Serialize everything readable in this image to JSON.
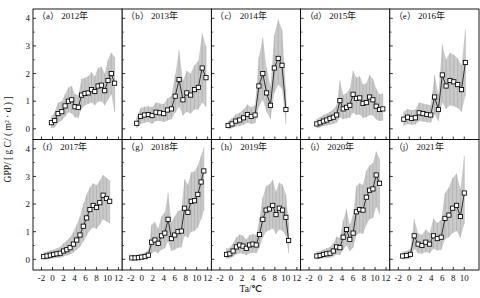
{
  "figure": {
    "name": "gpp-vs-air-temperature-panels",
    "ylabel": "GPP/ [ g C/ ( m² · d ) ]",
    "xlabel": "Ta/℃",
    "rows": 2,
    "cols": 5
  },
  "chart_data": {
    "type": "line",
    "title": "GPP/ [ g C/ ( m² · d ) ]",
    "xlabel": "Ta/℃",
    "ylabel": "GPP/ [ g C/ ( m² · d ) ]",
    "xlim": [
      -3,
      12.5
    ],
    "ylim": [
      -0.35,
      4.3
    ],
    "xticks": [
      -2,
      0,
      2,
      4,
      6,
      8,
      10,
      12
    ],
    "yticks": [
      0,
      1,
      2,
      3,
      4
    ],
    "grid": false,
    "legend": "none",
    "marker": "open-square",
    "band_label": "shaded standard-deviation envelope",
    "band_color": "#b8b8b8",
    "line_color": "#1a1a1a",
    "panels": [
      {
        "id": "a",
        "label": "（a）",
        "title": "2012年",
        "xticks": [
          -2,
          0,
          2,
          4,
          6,
          8,
          10,
          12
        ],
        "x": [
          -0.2,
          0.4,
          1.0,
          1.7,
          2.3,
          2.9,
          3.5,
          4.1,
          4.7,
          5.3,
          5.9,
          6.5,
          7.1,
          7.7,
          8.3,
          8.9,
          9.5,
          10.1,
          10.7,
          11.3
        ],
        "y": [
          0.22,
          0.3,
          0.55,
          0.62,
          0.83,
          1.0,
          1.05,
          0.8,
          0.78,
          1.22,
          1.28,
          1.3,
          1.42,
          1.35,
          1.55,
          1.58,
          1.38,
          1.75,
          2.0,
          1.65
        ],
        "lower": [
          0.02,
          0.05,
          0.22,
          0.3,
          0.45,
          0.6,
          0.55,
          0.42,
          0.4,
          0.72,
          0.85,
          0.9,
          0.95,
          0.85,
          0.98,
          1.0,
          0.85,
          1.05,
          1.25,
          0.6
        ],
        "upper": [
          0.45,
          0.6,
          0.95,
          1.0,
          1.25,
          1.5,
          1.55,
          1.25,
          1.22,
          1.8,
          1.85,
          1.9,
          2.05,
          1.9,
          2.2,
          2.25,
          2.0,
          2.5,
          2.75,
          2.6
        ]
      },
      {
        "id": "b",
        "label": "（b）",
        "title": "2013年",
        "xticks": [
          -2,
          0,
          2,
          4,
          6,
          8,
          10,
          12
        ],
        "x": [
          -0.9,
          -0.2,
          0.5,
          1.2,
          1.9,
          2.6,
          3.3,
          4.0,
          4.7,
          5.4,
          6.1,
          6.8,
          7.5,
          8.2,
          8.9,
          9.6,
          10.3,
          11.0,
          11.7
        ],
        "y": [
          0.2,
          0.45,
          0.5,
          0.52,
          0.48,
          0.6,
          0.58,
          0.55,
          0.68,
          0.72,
          1.18,
          1.78,
          1.05,
          1.3,
          1.22,
          1.42,
          1.5,
          2.2,
          1.85
        ],
        "lower": [
          0.02,
          0.18,
          0.22,
          0.25,
          0.18,
          0.28,
          0.28,
          0.25,
          0.3,
          0.35,
          0.58,
          0.8,
          0.48,
          0.62,
          0.55,
          0.7,
          0.7,
          0.95,
          0.8
        ],
        "upper": [
          0.42,
          0.75,
          0.8,
          0.82,
          0.78,
          0.95,
          0.92,
          0.9,
          1.1,
          1.2,
          1.95,
          2.85,
          1.75,
          2.1,
          2.0,
          2.3,
          2.45,
          3.45,
          3.0
        ]
      },
      {
        "id": "c",
        "label": "（c）",
        "title": "2014年",
        "xticks": [
          -2,
          0,
          2,
          4,
          6,
          8,
          10,
          12
        ],
        "x": [
          -0.5,
          0.2,
          0.9,
          1.6,
          2.3,
          3.0,
          3.7,
          4.4,
          5.1,
          5.8,
          6.5,
          7.2,
          7.9,
          8.6,
          9.3,
          10.0
        ],
        "y": [
          0.12,
          0.18,
          0.28,
          0.32,
          0.4,
          0.52,
          0.45,
          0.5,
          1.55,
          2.0,
          1.3,
          0.85,
          2.2,
          2.55,
          2.3,
          0.7
        ],
        "lower": [
          0.0,
          0.02,
          0.08,
          0.1,
          0.15,
          0.22,
          0.18,
          0.2,
          0.8,
          1.05,
          0.62,
          0.35,
          1.3,
          1.6,
          1.45,
          0.18
        ],
        "upper": [
          0.28,
          0.38,
          0.52,
          0.58,
          0.7,
          0.88,
          0.78,
          0.85,
          2.6,
          3.3,
          2.2,
          1.55,
          3.4,
          3.95,
          3.6,
          1.45
        ]
      },
      {
        "id": "d",
        "label": "（d）",
        "title": "2015年",
        "xticks": [
          -2,
          0,
          2,
          4,
          6,
          8,
          10,
          12
        ],
        "x": [
          -0.6,
          0.0,
          0.6,
          1.2,
          1.8,
          2.4,
          3.0,
          3.6,
          4.2,
          4.8,
          5.4,
          6.0,
          6.6,
          7.2,
          7.8,
          8.4,
          9.0,
          9.6,
          10.2,
          10.8,
          11.4
        ],
        "y": [
          0.18,
          0.22,
          0.28,
          0.32,
          0.38,
          0.42,
          0.5,
          1.02,
          0.72,
          0.78,
          0.85,
          1.25,
          1.1,
          1.12,
          0.92,
          0.95,
          1.15,
          1.05,
          0.82,
          0.7,
          0.72
        ],
        "lower": [
          0.02,
          0.05,
          0.1,
          0.12,
          0.16,
          0.18,
          0.22,
          0.42,
          0.35,
          0.38,
          0.4,
          0.58,
          0.5,
          0.52,
          0.4,
          0.42,
          0.5,
          0.48,
          0.35,
          0.28,
          0.3
        ],
        "upper": [
          0.35,
          0.42,
          0.5,
          0.55,
          0.62,
          0.7,
          0.85,
          1.75,
          1.22,
          1.3,
          1.45,
          2.1,
          1.85,
          1.9,
          1.6,
          1.65,
          1.95,
          1.8,
          1.45,
          1.25,
          1.28
        ]
      },
      {
        "id": "e",
        "label": "（e）",
        "title": "2016年",
        "xticks": [
          -2,
          0,
          2,
          4,
          6,
          8,
          10
        ],
        "x": [
          -1.0,
          -0.3,
          0.4,
          1.1,
          1.8,
          2.5,
          3.2,
          3.9,
          4.6,
          5.3,
          6.0,
          6.7,
          7.4,
          8.1,
          8.8,
          9.5,
          10.2
        ],
        "y": [
          0.35,
          0.42,
          0.38,
          0.4,
          0.58,
          0.55,
          0.52,
          0.5,
          1.15,
          0.7,
          1.95,
          1.55,
          1.75,
          1.7,
          1.6,
          1.42,
          2.4
        ],
        "lower": [
          0.12,
          0.18,
          0.15,
          0.16,
          0.28,
          0.26,
          0.24,
          0.22,
          0.52,
          0.28,
          0.95,
          0.72,
          0.85,
          0.82,
          0.75,
          0.62,
          1.2
        ],
        "upper": [
          0.62,
          0.72,
          0.68,
          0.7,
          0.95,
          0.92,
          0.88,
          0.85,
          1.95,
          1.25,
          3.05,
          2.5,
          2.75,
          2.68,
          2.55,
          2.3,
          3.6
        ]
      },
      {
        "id": "f",
        "label": "（f）",
        "title": "2017年",
        "xticks": [
          -2,
          0,
          2,
          4,
          6,
          8,
          10,
          12
        ],
        "x": [
          -1.6,
          -1.0,
          -0.4,
          0.2,
          0.8,
          1.4,
          2.0,
          2.6,
          3.2,
          3.8,
          4.4,
          5.0,
          5.6,
          6.2,
          6.8,
          7.4,
          8.0,
          8.6,
          9.2,
          9.8,
          10.4
        ],
        "y": [
          0.1,
          0.12,
          0.15,
          0.18,
          0.2,
          0.22,
          0.3,
          0.35,
          0.42,
          0.55,
          0.7,
          0.88,
          1.2,
          1.5,
          1.8,
          1.95,
          1.88,
          2.05,
          2.32,
          2.2,
          2.1
        ],
        "lower": [
          0.0,
          0.0,
          0.02,
          0.04,
          0.05,
          0.06,
          0.1,
          0.14,
          0.18,
          0.25,
          0.35,
          0.45,
          0.65,
          0.85,
          1.05,
          1.15,
          1.1,
          1.25,
          1.45,
          1.38,
          1.3
        ],
        "upper": [
          0.25,
          0.28,
          0.32,
          0.36,
          0.4,
          0.45,
          0.58,
          0.68,
          0.8,
          1.0,
          1.25,
          1.55,
          2.0,
          2.35,
          2.6,
          2.75,
          2.68,
          2.85,
          3.05,
          2.95,
          2.85
        ]
      },
      {
        "id": "g",
        "label": "（g）",
        "title": "2018年",
        "xticks": [
          -2,
          0,
          2,
          4,
          6,
          8,
          10,
          12
        ],
        "x": [
          -1.8,
          -1.2,
          -0.6,
          0.0,
          0.6,
          1.2,
          1.8,
          2.4,
          3.0,
          3.6,
          4.2,
          4.8,
          5.4,
          6.0,
          6.6,
          7.2,
          7.8,
          8.4,
          9.0,
          9.6,
          10.2,
          10.8,
          11.3
        ],
        "y": [
          0.05,
          0.05,
          0.06,
          0.08,
          0.1,
          0.15,
          0.62,
          0.7,
          0.58,
          0.85,
          0.95,
          1.45,
          0.75,
          0.88,
          1.0,
          1.02,
          1.85,
          1.7,
          2.1,
          2.12,
          2.35,
          2.8,
          3.2
        ],
        "lower": [
          0.0,
          0.0,
          0.0,
          0.0,
          0.02,
          0.04,
          0.22,
          0.28,
          0.22,
          0.35,
          0.4,
          0.65,
          0.3,
          0.35,
          0.42,
          0.44,
          0.85,
          0.78,
          1.0,
          1.02,
          1.15,
          1.45,
          1.75
        ],
        "upper": [
          0.15,
          0.15,
          0.18,
          0.2,
          0.25,
          0.35,
          1.25,
          1.35,
          1.12,
          1.55,
          1.7,
          2.4,
          1.35,
          1.55,
          1.75,
          1.8,
          2.9,
          2.7,
          3.15,
          3.18,
          3.4,
          3.75,
          4.05
        ]
      },
      {
        "id": "h",
        "label": "（h）",
        "title": "2019年",
        "xticks": [
          -2,
          0,
          2,
          4,
          6,
          8,
          10,
          12
        ],
        "x": [
          -0.8,
          -0.2,
          0.4,
          1.0,
          1.6,
          2.2,
          2.8,
          3.4,
          4.0,
          4.6,
          5.2,
          5.8,
          6.4,
          7.0,
          7.6,
          8.2,
          8.8,
          9.4,
          10.0,
          10.5
        ],
        "y": [
          0.18,
          0.2,
          0.3,
          0.45,
          0.52,
          0.48,
          0.4,
          0.52,
          0.55,
          0.52,
          0.9,
          1.45,
          1.78,
          1.82,
          1.95,
          1.62,
          1.85,
          1.78,
          1.52,
          0.68
        ],
        "lower": [
          0.02,
          0.04,
          0.1,
          0.18,
          0.22,
          0.2,
          0.15,
          0.22,
          0.24,
          0.22,
          0.42,
          0.78,
          1.0,
          1.05,
          1.12,
          0.92,
          1.08,
          1.02,
          0.85,
          0.22
        ],
        "upper": [
          0.4,
          0.42,
          0.58,
          0.8,
          0.9,
          0.85,
          0.72,
          0.88,
          0.92,
          0.88,
          1.5,
          2.25,
          2.65,
          2.72,
          2.88,
          2.45,
          2.78,
          2.7,
          2.35,
          1.35
        ]
      },
      {
        "id": "i",
        "label": "（i）",
        "title": "2020年",
        "xticks": [
          -2,
          0,
          2,
          4,
          6,
          8,
          10,
          12
        ],
        "x": [
          -0.6,
          0.0,
          0.6,
          1.2,
          1.8,
          2.4,
          3.0,
          3.6,
          4.2,
          4.8,
          5.4,
          6.0,
          6.6,
          7.2,
          7.8,
          8.4,
          9.0,
          9.6,
          10.2,
          10.8
        ],
        "y": [
          0.12,
          0.14,
          0.18,
          0.2,
          0.22,
          0.3,
          0.45,
          0.42,
          0.8,
          1.08,
          0.72,
          0.95,
          1.72,
          1.8,
          1.78,
          2.25,
          2.5,
          2.55,
          3.05,
          2.75
        ],
        "lower": [
          0.0,
          0.02,
          0.04,
          0.05,
          0.06,
          0.1,
          0.18,
          0.16,
          0.35,
          0.5,
          0.3,
          0.42,
          0.88,
          0.95,
          0.92,
          1.25,
          1.45,
          1.5,
          1.9,
          1.65
        ],
        "upper": [
          0.28,
          0.3,
          0.36,
          0.4,
          0.45,
          0.58,
          0.82,
          0.78,
          1.4,
          1.82,
          1.25,
          1.6,
          2.65,
          2.75,
          2.7,
          3.2,
          3.4,
          3.48,
          3.9,
          3.65
        ]
      },
      {
        "id": "j",
        "label": "（j）",
        "title": "2021年",
        "xticks": [
          -2,
          0,
          2,
          4,
          6,
          8,
          10
        ],
        "x": [
          -1.2,
          -0.5,
          0.2,
          0.9,
          1.6,
          2.3,
          3.0,
          3.7,
          4.4,
          5.1,
          5.8,
          6.5,
          7.2,
          7.9,
          8.6,
          9.3,
          10.0
        ],
        "y": [
          0.12,
          0.14,
          0.18,
          0.85,
          0.55,
          0.5,
          0.62,
          0.55,
          0.85,
          0.75,
          0.8,
          1.48,
          1.6,
          1.85,
          1.95,
          1.55,
          2.4
        ],
        "lower": [
          0.0,
          0.0,
          0.02,
          0.38,
          0.22,
          0.2,
          0.26,
          0.22,
          0.38,
          0.32,
          0.35,
          0.72,
          0.8,
          0.95,
          1.02,
          0.78,
          1.28
        ],
        "upper": [
          0.28,
          0.3,
          0.38,
          1.45,
          0.95,
          0.88,
          1.08,
          0.95,
          1.48,
          1.32,
          1.42,
          2.4,
          2.6,
          2.95,
          3.1,
          2.55,
          3.75
        ]
      }
    ]
  }
}
